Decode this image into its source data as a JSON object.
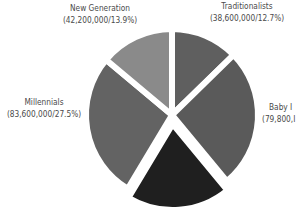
{
  "chart_data": {
    "type": "pie",
    "title": "",
    "start_angle_deg": 0,
    "direction": "clockwise",
    "slices": [
      {
        "label": "Traditionalists",
        "value": 38600000,
        "percent": 12.7,
        "value_text": "(38,600,000/12.7%)",
        "color": "#5f5f5f",
        "explode": 0
      },
      {
        "label": "Baby Boomers",
        "value": 79800000,
        "percent": 26.3,
        "value_text": "(79,800,000/26.3%)",
        "color": "#5a5a5a",
        "explode": 0,
        "label_visible_text": "Baby I",
        "value_visible_text": "(79,800,I"
      },
      {
        "label": "Generation X",
        "value": 59400000,
        "percent": 19.6,
        "value_text": "",
        "color": "#1f1f1f",
        "explode": 9,
        "label_visible": false
      },
      {
        "label": "Millennials",
        "value": 83600000,
        "percent": 27.5,
        "value_text": "(83,600,000/27.5%)",
        "color": "#636363",
        "explode": 0
      },
      {
        "label": "New Generation",
        "value": 42200000,
        "percent": 13.9,
        "value_text": "(42,200,000/13.9%)",
        "color": "#8a8a8a",
        "explode": 0
      }
    ],
    "legend": "none",
    "labels_position": "outside"
  },
  "labels": {
    "new_generation": {
      "name": "New Generation",
      "value": "(42,200,000/13.9%)"
    },
    "traditionalists": {
      "name": "Traditionalists",
      "value": "(38,600,000/12.7%)"
    },
    "baby_boomers": {
      "name": "Baby I",
      "value": "(79,800,I"
    },
    "millennials": {
      "name": "Millennials",
      "value": "(83,600,000/27.5%)"
    }
  },
  "geometry": {
    "cx": 172,
    "cy": 115,
    "r": 86,
    "gap": 3
  }
}
